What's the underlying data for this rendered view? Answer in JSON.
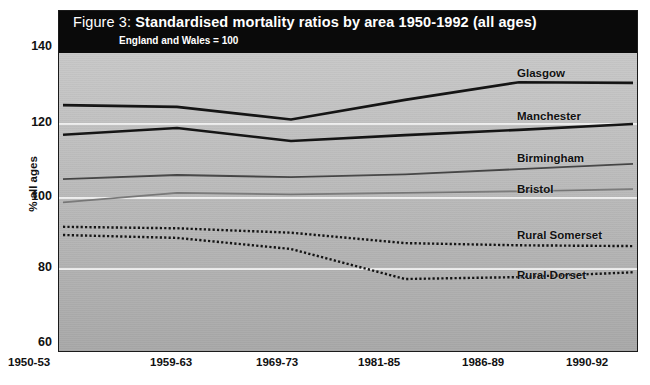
{
  "figure": {
    "number_label": "Figure 3:",
    "title": "Standardised mortality ratios by area 1950-1992 (all ages)",
    "subtitle": "England and Wales = 100"
  },
  "axes": {
    "ylabel": "% all ages",
    "yticks": [
      "140",
      "120",
      "100",
      "80",
      "60"
    ],
    "xticks": [
      "1950-53",
      "1959-63",
      "1969-73",
      "1981-85",
      "1986-89",
      "1990-92"
    ]
  },
  "series_labels": {
    "glasgow": "Glasgow",
    "manchester": "Manchester",
    "birmingham": "Birmingham",
    "bristol": "Bristol",
    "rural_somerset": "Rural Somerset",
    "rural_dorset": "Rural Dorset"
  },
  "chart_data": {
    "type": "line",
    "title": "Figure 3: Standardised mortality ratios by area 1950-1992 (all ages)",
    "subtitle": "England and Wales = 100",
    "xlabel": "",
    "ylabel": "% all ages",
    "ylim": [
      60,
      140
    ],
    "yticks": [
      60,
      80,
      100,
      120,
      140
    ],
    "grid": true,
    "gridlines_at": [
      80,
      100,
      120,
      140
    ],
    "legend": "inline-right-labels",
    "categories": [
      "1950-53",
      "1959-63",
      "1969-73",
      "1981-85",
      "1986-89",
      "1990-92"
    ],
    "series": [
      {
        "name": "Glasgow",
        "values": [
          124.3,
          123.8,
          120.4,
          125.7,
          130.5,
          130.3
        ],
        "style": "solid",
        "color": "#111111",
        "width": 2.6
      },
      {
        "name": "Manchester",
        "values": [
          116.3,
          118.1,
          114.6,
          116.2,
          117.6,
          119.2
        ],
        "style": "solid",
        "color": "#111111",
        "width": 2.6
      },
      {
        "name": "Birmingham",
        "values": [
          104.3,
          105.4,
          104.8,
          105.6,
          107.0,
          108.4
        ],
        "style": "solid",
        "color": "#444444",
        "width": 1.8
      },
      {
        "name": "Bristol",
        "values": [
          98.0,
          100.6,
          100.2,
          100.6,
          101.0,
          101.6
        ],
        "style": "solid",
        "color": "#777777",
        "width": 1.8
      },
      {
        "name": "Rural Somerset",
        "values": [
          91.4,
          91.0,
          89.8,
          87.0,
          86.4,
          86.2
        ],
        "style": "dotted",
        "color": "#111111",
        "width": 2.4
      },
      {
        "name": "Rural Dorset",
        "values": [
          89.2,
          88.4,
          85.4,
          77.3,
          77.8,
          79.1
        ],
        "style": "dotted",
        "color": "#111111",
        "width": 2.4
      }
    ]
  }
}
